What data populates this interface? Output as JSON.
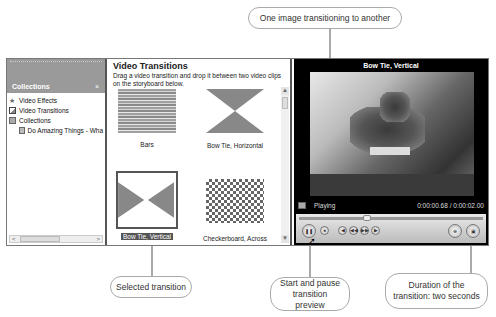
{
  "left_pane": {
    "title": "Collections",
    "close": "×",
    "tree": [
      {
        "label": "Video Effects",
        "icon": "star-icon"
      },
      {
        "label": "Video Transitions",
        "icon": "transition-icon"
      },
      {
        "label": "Collections",
        "icon": "collections-icon"
      },
      {
        "label": "Do Amazing Things - Wha",
        "icon": "collection-folder-icon",
        "child": true
      }
    ],
    "scroll_left": "<",
    "scroll_right": ">"
  },
  "middle_pane": {
    "title": "Video Transitions",
    "description": "Drag a video transition and drop it between two video clips on the storyboard below.",
    "transitions": [
      {
        "label": "Bars"
      },
      {
        "label": "Bow Tie, Horizontal"
      },
      {
        "label": "Bow Tie, Vertical",
        "selected": true
      },
      {
        "label": "Checkerboard, Across"
      }
    ],
    "scroll_up": "▲",
    "scroll_down": "▼"
  },
  "preview": {
    "title": "Bow Tie, Vertical",
    "status": "Playing",
    "time": "0:00:00.68 / 0:00:02.00",
    "buttons": {
      "play_pause": "❚❚",
      "stop": "●",
      "prev": "◀",
      "rewind": "◀◀",
      "forward": "▶▶",
      "next": "▶",
      "split": "⊕",
      "snapshot": "▣"
    }
  },
  "callouts": {
    "top": "One image transitioning to another",
    "selected": "Selected transition",
    "start_pause": "Start and pause transition preview",
    "duration": "Duration of the transition: two seconds"
  }
}
